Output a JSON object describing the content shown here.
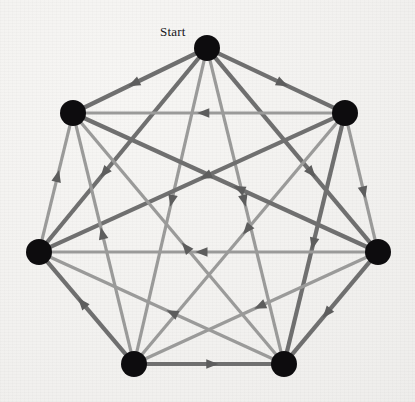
{
  "figure": {
    "title_label": "Start",
    "label_position": {
      "x": 160,
      "y": 25
    },
    "background_color": "#f4f3f1",
    "canvas": {
      "width": 415,
      "height": 402
    }
  },
  "style": {
    "node_color": "#0d0c0e",
    "node_radius": 13,
    "edge_color_light": "#9a9a99",
    "edge_color_dark": "#6f6f6f",
    "edge_width_light": 3.2,
    "edge_width_dark": 4.2,
    "arrow_color": "#5d5d5d",
    "arrow_size": 11
  },
  "chart_data": {
    "type": "diagram",
    "diagram_kind": "directed-graph-tournament",
    "title": "Start",
    "node_count": 7,
    "edge_count": 21,
    "layout": "regular-heptagon",
    "center": {
      "x": 208,
      "y": 238
    },
    "radius": 190,
    "nodes": [
      {
        "id": 0,
        "name": "start-node",
        "label": "Start",
        "x": 207,
        "y": 48
      },
      {
        "id": 1,
        "name": "node-upper-right",
        "label": "",
        "x": 345,
        "y": 113
      },
      {
        "id": 2,
        "name": "node-right",
        "label": "",
        "x": 378,
        "y": 252
      },
      {
        "id": 3,
        "name": "node-bottom-right",
        "label": "",
        "x": 284,
        "y": 364
      },
      {
        "id": 4,
        "name": "node-bottom-left",
        "label": "",
        "x": 134,
        "y": 364
      },
      {
        "id": 5,
        "name": "node-left",
        "label": "",
        "x": 39,
        "y": 252
      },
      {
        "id": 6,
        "name": "node-upper-left",
        "label": "",
        "x": 73,
        "y": 113
      }
    ],
    "edges": [
      {
        "from": 0,
        "to": 6,
        "weight": "dark",
        "arrow_t": 0.55
      },
      {
        "from": 0,
        "to": 1,
        "weight": "dark",
        "arrow_t": 0.55
      },
      {
        "from": 0,
        "to": 5,
        "weight": "dark",
        "arrow_t": 0.62
      },
      {
        "from": 0,
        "to": 2,
        "weight": "dark",
        "arrow_t": 0.62
      },
      {
        "from": 0,
        "to": 4,
        "weight": "light",
        "arrow_t": 0.48
      },
      {
        "from": 0,
        "to": 3,
        "weight": "light",
        "arrow_t": 0.48
      },
      {
        "from": 1,
        "to": 6,
        "weight": "light",
        "arrow_t": 0.52
      },
      {
        "from": 1,
        "to": 2,
        "weight": "light",
        "arrow_t": 0.58
      },
      {
        "from": 1,
        "to": 5,
        "weight": "dark",
        "arrow_t": 0.45
      },
      {
        "from": 1,
        "to": 3,
        "weight": "dark",
        "arrow_t": 0.52
      },
      {
        "from": 1,
        "to": 4,
        "weight": "light",
        "arrow_t": 0.46
      },
      {
        "from": 2,
        "to": 6,
        "weight": "dark",
        "arrow_t": 0.45
      },
      {
        "from": 2,
        "to": 5,
        "weight": "light",
        "arrow_t": 0.52
      },
      {
        "from": 2,
        "to": 3,
        "weight": "dark",
        "arrow_t": 0.55
      },
      {
        "from": 2,
        "to": 4,
        "weight": "light",
        "arrow_t": 0.48
      },
      {
        "from": 3,
        "to": 6,
        "weight": "light",
        "arrow_t": 0.46
      },
      {
        "from": 3,
        "to": 5,
        "weight": "light",
        "arrow_t": 0.45
      },
      {
        "from": 4,
        "to": 3,
        "weight": "dark",
        "arrow_t": 0.52
      },
      {
        "from": 4,
        "to": 5,
        "weight": "dark",
        "arrow_t": 0.55
      },
      {
        "from": 4,
        "to": 6,
        "weight": "light",
        "arrow_t": 0.52
      },
      {
        "from": 5,
        "to": 6,
        "weight": "light",
        "arrow_t": 0.55
      }
    ]
  }
}
